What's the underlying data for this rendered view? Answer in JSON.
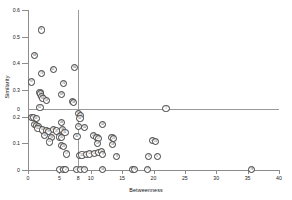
{
  "chart_data": {
    "type": "scatter",
    "title": "",
    "xlabel": "Betweenness",
    "ylabel": "Similarity",
    "xlim": [
      0,
      40
    ],
    "ylim": [
      0,
      0.6
    ],
    "xticks": [
      0,
      5,
      10,
      15,
      20,
      25,
      30,
      35,
      40
    ],
    "xtick_labels": [
      "0",
      "5",
      "10",
      "15",
      "20",
      "25",
      "30",
      "35",
      "40"
    ],
    "yticks": [
      0,
      0.1,
      0.2,
      0.3,
      0.4,
      0.5,
      0.6
    ],
    "ytick_labels": [
      "0",
      "0.1",
      "0.2",
      "0.3",
      "0.4",
      "0.5",
      "0.6"
    ],
    "grid": false,
    "legend": "none",
    "marker_style": "numbered-circle",
    "reference_lines": [
      {
        "orientation": "horizontal",
        "value": 0.23,
        "axis_label": "0"
      },
      {
        "orientation": "vertical",
        "value": 8,
        "axis_label": "8"
      }
    ],
    "points": [
      {
        "label": "74",
        "x": 2.1,
        "y": 0.525
      },
      {
        "label": "68",
        "x": 1.0,
        "y": 0.428
      },
      {
        "label": "61",
        "x": 4.0,
        "y": 0.378
      },
      {
        "label": "73",
        "x": 2.2,
        "y": 0.362
      },
      {
        "label": "60",
        "x": 7.4,
        "y": 0.385
      },
      {
        "label": "67",
        "x": 0.6,
        "y": 0.33
      },
      {
        "label": "70",
        "x": 5.7,
        "y": 0.325
      },
      {
        "label": "65",
        "x": 1.9,
        "y": 0.292
      },
      {
        "label": "64",
        "x": 2.0,
        "y": 0.285
      },
      {
        "label": "66",
        "x": 2.2,
        "y": 0.277
      },
      {
        "label": "63",
        "x": 2.4,
        "y": 0.268
      },
      {
        "label": "59",
        "x": 3.0,
        "y": 0.262
      },
      {
        "label": "69",
        "x": 5.4,
        "y": 0.283
      },
      {
        "label": "57",
        "x": 7.1,
        "y": 0.258
      },
      {
        "label": "58",
        "x": 7.3,
        "y": 0.252
      },
      {
        "label": "62",
        "x": 1.9,
        "y": 0.235
      },
      {
        "label": "7",
        "x": 22.0,
        "y": 0.23
      },
      {
        "label": "55",
        "x": 8.1,
        "y": 0.212
      },
      {
        "label": "54",
        "x": 8.4,
        "y": 0.203
      },
      {
        "label": "51",
        "x": 0.5,
        "y": 0.198
      },
      {
        "label": "52",
        "x": 0.9,
        "y": 0.196
      },
      {
        "label": "53",
        "x": 1.3,
        "y": 0.194
      },
      {
        "label": "50",
        "x": 8.3,
        "y": 0.192
      },
      {
        "label": "49",
        "x": 1.0,
        "y": 0.172
      },
      {
        "label": "48",
        "x": 1.4,
        "y": 0.168
      },
      {
        "label": "47",
        "x": 1.7,
        "y": 0.164
      },
      {
        "label": "46",
        "x": 5.3,
        "y": 0.178
      },
      {
        "label": "45",
        "x": 8.0,
        "y": 0.163
      },
      {
        "label": "44",
        "x": 9.0,
        "y": 0.16
      },
      {
        "label": "43",
        "x": 11.9,
        "y": 0.17
      },
      {
        "label": "42",
        "x": 1.6,
        "y": 0.155
      },
      {
        "label": "41",
        "x": 2.3,
        "y": 0.15
      },
      {
        "label": "40",
        "x": 3.0,
        "y": 0.148
      },
      {
        "label": "39",
        "x": 3.3,
        "y": 0.143
      },
      {
        "label": "38",
        "x": 4.1,
        "y": 0.152
      },
      {
        "label": "37",
        "x": 4.6,
        "y": 0.146
      },
      {
        "label": "36",
        "x": 5.5,
        "y": 0.15
      },
      {
        "label": "35",
        "x": 5.9,
        "y": 0.142
      },
      {
        "label": "34",
        "x": 2.6,
        "y": 0.128
      },
      {
        "label": "33",
        "x": 3.8,
        "y": 0.122
      },
      {
        "label": "32",
        "x": 5.0,
        "y": 0.124
      },
      {
        "label": "31",
        "x": 5.4,
        "y": 0.121
      },
      {
        "label": "30",
        "x": 7.8,
        "y": 0.126
      },
      {
        "label": "29",
        "x": 10.5,
        "y": 0.128
      },
      {
        "label": "28",
        "x": 11.0,
        "y": 0.122
      },
      {
        "label": "27",
        "x": 11.3,
        "y": 0.118
      },
      {
        "label": "26",
        "x": 13.4,
        "y": 0.122
      },
      {
        "label": "25",
        "x": 13.6,
        "y": 0.118
      },
      {
        "label": "24",
        "x": 19.9,
        "y": 0.11
      },
      {
        "label": "23",
        "x": 20.3,
        "y": 0.108
      },
      {
        "label": "22",
        "x": 3.4,
        "y": 0.105
      },
      {
        "label": "21",
        "x": 5.4,
        "y": 0.092
      },
      {
        "label": "20",
        "x": 5.7,
        "y": 0.088
      },
      {
        "label": "19",
        "x": 11.1,
        "y": 0.1
      },
      {
        "label": "18",
        "x": 13.5,
        "y": 0.095
      },
      {
        "label": "17",
        "x": 6.1,
        "y": 0.06
      },
      {
        "label": "16",
        "x": 8.2,
        "y": 0.055
      },
      {
        "label": "15",
        "x": 8.6,
        "y": 0.056
      },
      {
        "label": "14",
        "x": 9.3,
        "y": 0.058
      },
      {
        "label": "13",
        "x": 9.8,
        "y": 0.06
      },
      {
        "label": "12",
        "x": 10.6,
        "y": 0.062
      },
      {
        "label": "11",
        "x": 11.2,
        "y": 0.066
      },
      {
        "label": "10",
        "x": 11.7,
        "y": 0.07
      },
      {
        "label": "9",
        "x": 11.9,
        "y": 0.058
      },
      {
        "label": "8",
        "x": 14.1,
        "y": 0.05
      },
      {
        "label": "6",
        "x": 19.2,
        "y": 0.052
      },
      {
        "label": "5",
        "x": 20.6,
        "y": 0.052
      },
      {
        "label": "4",
        "x": 5.0,
        "y": 0.002
      },
      {
        "label": "3",
        "x": 5.6,
        "y": 0.002
      },
      {
        "label": "2",
        "x": 6.0,
        "y": 0.002
      },
      {
        "label": "1",
        "x": 7.7,
        "y": 0.002
      },
      {
        "label": "72",
        "x": 8.4,
        "y": 0.002
      },
      {
        "label": "71",
        "x": 9.0,
        "y": 0.002
      },
      {
        "label": "56",
        "x": 11.9,
        "y": 0.002
      },
      {
        "label": "75",
        "x": 16.7,
        "y": 0.002
      },
      {
        "label": "76",
        "x": 17.0,
        "y": 0.002
      },
      {
        "label": "77",
        "x": 19.1,
        "y": 0.002
      },
      {
        "label": "78",
        "x": 35.6,
        "y": 0.002
      }
    ]
  }
}
